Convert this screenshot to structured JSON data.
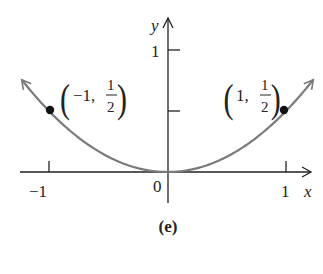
{
  "chart_data": {
    "type": "line",
    "function": "y = x^2 / 2",
    "title": "",
    "caption": "(e)",
    "xlabel": "x",
    "ylabel": "y",
    "xlim": [
      -1.25,
      1.25
    ],
    "ylim": [
      0,
      1.1
    ],
    "x_ticks": [
      {
        "value": -1,
        "label": "−1"
      },
      {
        "value": 1,
        "label": "1"
      }
    ],
    "y_ticks": [
      {
        "value": 0.5,
        "label": ""
      },
      {
        "value": 1,
        "label": "1"
      }
    ],
    "origin_label": "0",
    "grid": false,
    "legend": null,
    "series": [
      {
        "name": "parabola",
        "x": [
          -1.23,
          -1,
          -0.75,
          -0.5,
          -0.25,
          0,
          0.25,
          0.5,
          0.75,
          1,
          1.23
        ],
        "values": [
          0.756,
          0.5,
          0.281,
          0.125,
          0.031,
          0,
          0.031,
          0.125,
          0.281,
          0.5,
          0.756
        ],
        "color": "#7a7a7a",
        "arrows_at_ends": true
      }
    ],
    "annotations": [
      {
        "x": -1,
        "y": 0.5,
        "label": "(−1, 1/2)",
        "marker": "filled-dot"
      },
      {
        "x": 1,
        "y": 0.5,
        "label": "(1, 1/2)",
        "marker": "filled-dot"
      }
    ]
  },
  "labels": {
    "y_axis": "y",
    "x_axis": "x",
    "tick_y1": "1",
    "tick_xm1": "−1",
    "tick_x1": "1",
    "origin": "0",
    "caption": "(e)",
    "left_point": {
      "open": "(",
      "x": "−1,",
      "num": "1",
      "den": "2",
      "close": ")"
    },
    "right_point": {
      "open": "(",
      "x": "1,",
      "num": "1",
      "den": "2",
      "close": ")"
    }
  }
}
